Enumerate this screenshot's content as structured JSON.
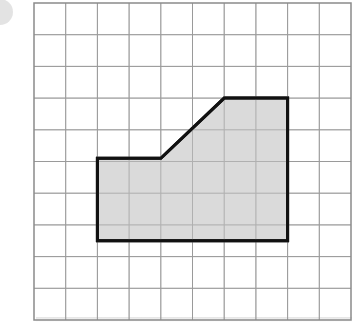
{
  "diagram": {
    "type": "grid-polygon",
    "grid": {
      "columns": 10,
      "rows": 10,
      "origin_px": [
        34,
        3
      ],
      "cell_px": 31.7,
      "line_color": "#9a9a9a",
      "border_color": "#8a8a8a"
    },
    "shape": {
      "name": "shaded-polygon",
      "fill": "#d3d3d3",
      "stroke": "#111111",
      "stroke_width": 3,
      "vertices_grid_units": [
        [
          2,
          4.9
        ],
        [
          4,
          4.9
        ],
        [
          6,
          3
        ],
        [
          8,
          3
        ],
        [
          8,
          7.5
        ],
        [
          2,
          7.5
        ]
      ]
    },
    "decoration": {
      "corner_circle_color": "#d9d9d9"
    }
  }
}
